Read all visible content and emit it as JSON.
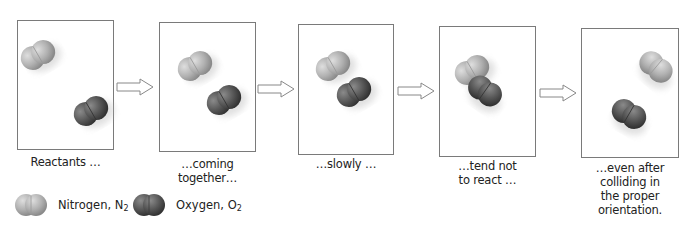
{
  "diagram": {
    "type": "reaction-sequence",
    "panels": [
      {
        "id": 1,
        "caption": [
          "Reactants …"
        ],
        "nitrogen": {
          "x": 38,
          "y": 55,
          "angle": -30
        },
        "oxygen": {
          "x": 91,
          "y": 111,
          "angle": -30
        }
      },
      {
        "id": 2,
        "caption": [
          "…coming",
          "together…"
        ],
        "nitrogen": {
          "x": 195,
          "y": 66,
          "angle": -30
        },
        "oxygen": {
          "x": 224,
          "y": 100,
          "angle": -30
        }
      },
      {
        "id": 3,
        "caption": [
          "…slowly …"
        ],
        "nitrogen": {
          "x": 333,
          "y": 66,
          "angle": -30
        },
        "oxygen": {
          "x": 354,
          "y": 92,
          "angle": -30
        }
      },
      {
        "id": 4,
        "caption": [
          "…tend not",
          "to react …"
        ],
        "nitrogen": {
          "x": 472,
          "y": 70,
          "angle": -30
        },
        "oxygen": {
          "x": 485,
          "y": 91,
          "angle": 35
        }
      },
      {
        "id": 5,
        "caption": [
          "…even after",
          "colliding in",
          "the proper",
          "orientation."
        ],
        "nitrogen": {
          "x": 656,
          "y": 67,
          "angle": 40
        },
        "oxygen": {
          "x": 629,
          "y": 114,
          "angle": 30
        }
      }
    ],
    "arrows": 4,
    "legend": [
      {
        "label": "Nitrogen, N",
        "subscript": "2",
        "color": "#b8b8b8"
      },
      {
        "label": "Oxygen, O",
        "subscript": "2",
        "color": "#5e5e5e"
      }
    ],
    "colors": {
      "nitrogen": "#b5b5b5",
      "oxygen": "#555555",
      "panel_border": "#7a7a7a"
    }
  }
}
